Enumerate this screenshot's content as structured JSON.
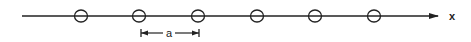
{
  "diagram": {
    "axis": {
      "label": "x",
      "x_start": 22,
      "x_end": 438,
      "y": 16,
      "color": "#222222"
    },
    "circles": [
      {
        "cx": 81,
        "cy": 16,
        "r": 6
      },
      {
        "cx": 139,
        "cy": 16,
        "r": 6
      },
      {
        "cx": 198,
        "cy": 16,
        "r": 6
      },
      {
        "cx": 257,
        "cy": 16,
        "r": 6
      },
      {
        "cx": 315,
        "cy": 16,
        "r": 6
      },
      {
        "cx": 374,
        "cy": 16,
        "r": 6
      }
    ],
    "spacing": {
      "label": "a",
      "x_start": 141,
      "x_end": 199,
      "y": 33
    }
  }
}
